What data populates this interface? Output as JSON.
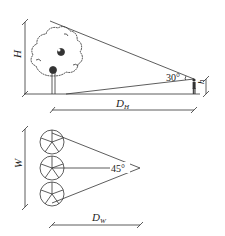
{
  "top_diagram": {
    "height_label": "H",
    "distance_label": "D",
    "distance_subscript": "H",
    "angle_label": "30°",
    "eye_height_label": "h"
  },
  "bottom_diagram": {
    "width_label": "W",
    "distance_label": "D",
    "distance_subscript": "W",
    "angle_label": "45°"
  },
  "colors": {
    "line": "#333333",
    "background": "#ffffff"
  }
}
